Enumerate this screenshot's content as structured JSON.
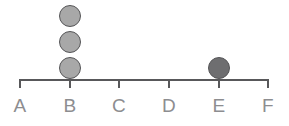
{
  "chart_data": {
    "type": "scatter",
    "chart_subtype": "dot-plot",
    "title": "",
    "subtitle": "",
    "xlabel": "",
    "ylabel": "",
    "grid": false,
    "legend": "none",
    "categories": [
      "A",
      "B",
      "C",
      "D",
      "E",
      "F"
    ],
    "values": [
      0,
      3,
      0,
      0,
      1,
      0
    ],
    "series": [
      {
        "name": "count",
        "values": [
          0,
          3,
          0,
          0,
          1,
          0
        ]
      }
    ],
    "points": [
      {
        "category": "B",
        "stack_index": 1,
        "fill": "#a8a8a8"
      },
      {
        "category": "B",
        "stack_index": 2,
        "fill": "#a8a8a8"
      },
      {
        "category": "B",
        "stack_index": 3,
        "fill": "#a8a8a8"
      },
      {
        "category": "E",
        "stack_index": 1,
        "fill": "#6e6e70"
      }
    ],
    "axis_ticks": [
      "A",
      "B",
      "C",
      "D",
      "E",
      "F"
    ],
    "ylim": [
      0,
      3
    ]
  },
  "axis": {
    "tick_labels": [
      {
        "label": "A",
        "x": 20
      },
      {
        "label": "B",
        "x": 70
      },
      {
        "label": "C",
        "x": 119
      },
      {
        "label": "D",
        "x": 169
      },
      {
        "label": "E",
        "x": 219
      },
      {
        "label": "F",
        "x": 268
      }
    ]
  },
  "dots": [
    {
      "cx": 70,
      "cy": 16,
      "fill": "#a8a8a8",
      "stroke": "#555557"
    },
    {
      "cx": 70,
      "cy": 42,
      "fill": "#a8a8a8",
      "stroke": "#555557"
    },
    {
      "cx": 70,
      "cy": 68,
      "fill": "#a8a8a8",
      "stroke": "#555557"
    },
    {
      "cx": 219,
      "cy": 68,
      "fill": "#6e6e70",
      "stroke": "#555557"
    }
  ],
  "colors": {
    "axis": "#58585a",
    "label": "#8d8d90",
    "dot_light": "#a8a8a8",
    "dot_dark": "#6e6e70",
    "background": "#ffffff"
  }
}
